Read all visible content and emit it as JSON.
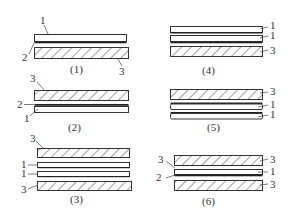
{
  "figure": {
    "legend": {
      "1": "white layer",
      "2": "thin dark layer",
      "3": "hatched layer"
    },
    "colors": {
      "stroke": "#333333",
      "dark_layer": "#222222",
      "background": "#ffffff"
    },
    "panels": [
      {
        "caption": "(1)",
        "labels": [
          "1",
          "2",
          "3"
        ],
        "stack_top_to_bottom": [
          "1",
          "2",
          "3"
        ]
      },
      {
        "caption": "(2)",
        "labels": [
          "3",
          "2",
          "1"
        ],
        "stack_top_to_bottom": [
          "3",
          "2",
          "1"
        ]
      },
      {
        "caption": "(3)",
        "labels": [
          "3",
          "1",
          "1",
          "3"
        ],
        "stack_top_to_bottom": [
          "3",
          "1",
          "1",
          "3"
        ]
      },
      {
        "caption": "(4)",
        "labels": [
          "1",
          "1",
          "3"
        ],
        "stack_top_to_bottom": [
          "1",
          "1",
          "3"
        ]
      },
      {
        "caption": "(5)",
        "labels": [
          "3",
          "1",
          "1"
        ],
        "stack_top_to_bottom": [
          "3",
          "1",
          "1"
        ]
      },
      {
        "caption": "(6)",
        "labels": [
          "3",
          "3",
          "2",
          "1",
          "3"
        ],
        "stack_top_to_bottom": [
          "3",
          "2",
          "1",
          "3"
        ]
      }
    ]
  }
}
